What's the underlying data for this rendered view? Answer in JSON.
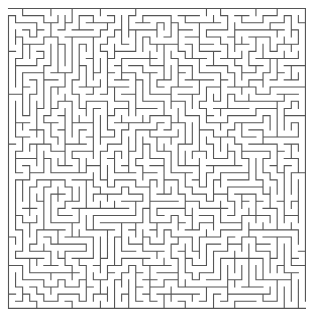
{
  "maze": {
    "cols": 42,
    "rows": 42,
    "origin_x": 8.5,
    "origin_y": 8.5,
    "cell_w": 7.07,
    "cell_h": 7.14,
    "wall_color": "#555555",
    "background": "#ffffff",
    "wall_width": 1.1,
    "seed": 9137,
    "entrance": {
      "side": "left",
      "row": 0
    },
    "exit": {
      "side": "right",
      "row": 41
    }
  }
}
